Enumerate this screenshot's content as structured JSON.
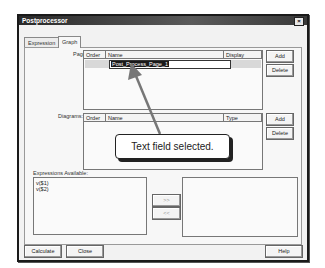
{
  "window": {
    "title": "Postprocessor",
    "close_glyph": "×"
  },
  "tabs": [
    {
      "label": "Expression",
      "active": false
    },
    {
      "label": "Graph",
      "active": true
    }
  ],
  "pages": {
    "label": "Pages:",
    "columns": [
      "Order",
      "Name",
      "Display"
    ],
    "rows": [
      {
        "order": "",
        "name": "Post_Process_Page_1",
        "display": ""
      }
    ],
    "edit_value": "Post_Process_Page_1",
    "add_label": "Add",
    "delete_label": "Delete"
  },
  "diagrams": {
    "label": "Diagrams:",
    "columns": [
      "Order",
      "Name",
      "Type"
    ],
    "rows": [],
    "add_label": "Add",
    "delete_label": "Delete"
  },
  "expressions": {
    "label": "Expressions Available:",
    "items": [
      "v($1)",
      "v($2)"
    ],
    "move_right_label": ">>",
    "move_left_label": "<<",
    "selected_items": []
  },
  "footer": {
    "calculate_label": "Calculate",
    "close_label": "Close",
    "help_label": "Help"
  },
  "annotation": {
    "text": "Text field selected.",
    "color": "#777777"
  }
}
